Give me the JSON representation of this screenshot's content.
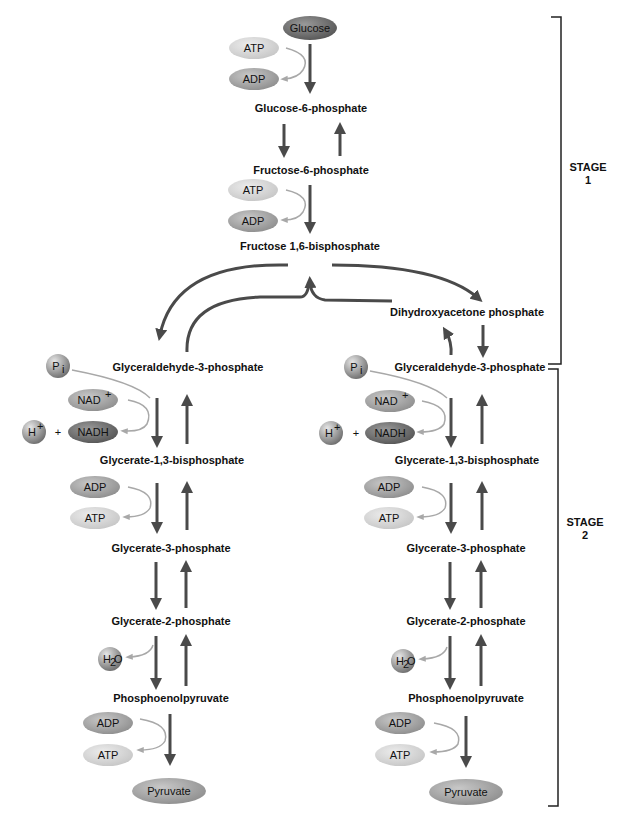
{
  "colors": {
    "main_arrow": "#4a4a4a",
    "side_arrow": "#a8a8a8",
    "pill_dark": "#6e6e6e",
    "pill_mid": "#a6a6a6",
    "pill_light": "#d4d4d4",
    "text": "#111111"
  },
  "stage1": {
    "glucose": "Glucose",
    "atp_1": "ATP",
    "adp_1": "ADP",
    "g6p": "Glucose-6-phosphate",
    "f6p": "Fructose-6-phosphate",
    "atp_2": "ATP",
    "adp_2": "ADP",
    "f16bp": "Fructose 1,6-bisphosphate",
    "dhap": "Dihydroxyacetone phosphate"
  },
  "branches": [
    {
      "side": "left",
      "gap": "Glyceraldehyde-3-phosphate",
      "pi": "P",
      "pi_sub": "i",
      "nad": "NAD",
      "nad_sup": "+",
      "h": "H",
      "h_sup": "+",
      "plus": "+",
      "nadh": "NADH",
      "g13bp": "Glycerate-1,3-bisphosphate",
      "adp_a": "ADP",
      "atp_a": "ATP",
      "g3p": "Glycerate-3-phosphate",
      "g2p": "Glycerate-2-phosphate",
      "h2o_h": "H",
      "h2o_sub": "2",
      "h2o_o": "O",
      "pep": "Phosphoenolpyruvate",
      "adp_b": "ADP",
      "atp_b": "ATP",
      "pyruvate": "Pyruvate"
    },
    {
      "side": "right",
      "gap": "Glyceraldehyde-3-phosphate",
      "pi": "P",
      "pi_sub": "i",
      "nad": "NAD",
      "nad_sup": "+",
      "h": "H",
      "h_sup": "+",
      "plus": "+",
      "nadh": "NADH",
      "g13bp": "Glycerate-1,3-bisphosphate",
      "adp_a": "ADP",
      "atp_a": "ATP",
      "g3p": "Glycerate-3-phosphate",
      "g2p": "Glycerate-2-phosphate",
      "h2o_h": "H",
      "h2o_sub": "2",
      "h2o_o": "O",
      "pep": "Phosphoenolpyruvate",
      "adp_b": "ADP",
      "atp_b": "ATP",
      "pyruvate": "Pyruvate"
    }
  ],
  "stages": [
    {
      "word": "STAGE",
      "number": "1"
    },
    {
      "word": "STAGE",
      "number": "2"
    }
  ]
}
